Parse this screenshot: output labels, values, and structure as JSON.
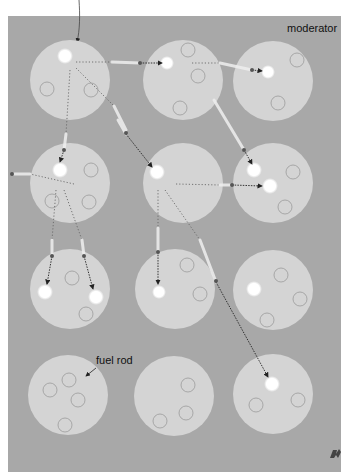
{
  "labels": {
    "moderator": "moderator",
    "fuel_rod": "fuel rod"
  },
  "colors": {
    "moderator_bg": "#a8a8a8",
    "fuel_rod": "#d4d4d4",
    "nucleus_outline": "#9a9a9a",
    "fission_flash": "#ffffff",
    "neutron_path": "#222222"
  },
  "diagram": {
    "grid": {
      "rows": 4,
      "cols": 3
    },
    "corner_mark": "logo"
  }
}
